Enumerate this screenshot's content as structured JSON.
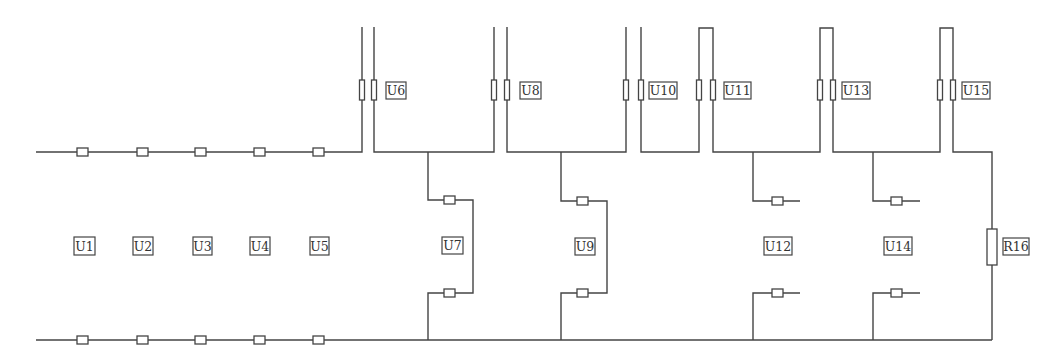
{
  "diagram": {
    "type": "circuit-schematic",
    "colors": {
      "line": "#444444",
      "background": "#ffffff",
      "text": "#333333"
    },
    "labels": {
      "U1": "U1",
      "U2": "U2",
      "U3": "U3",
      "U4": "U4",
      "U5": "U5",
      "U6": "U6",
      "U7": "U7",
      "U8": "U8",
      "U9": "U9",
      "U10": "U10",
      "U11": "U11",
      "U12": "U12",
      "U13": "U13",
      "U14": "U14",
      "U15": "U15",
      "R16": "R16"
    },
    "components": [
      {
        "id": "U1",
        "kind": "series-pair",
        "position": "left-bus"
      },
      {
        "id": "U2",
        "kind": "series-pair",
        "position": "left-bus"
      },
      {
        "id": "U3",
        "kind": "series-pair",
        "position": "left-bus"
      },
      {
        "id": "U4",
        "kind": "series-pair",
        "position": "left-bus"
      },
      {
        "id": "U5",
        "kind": "series-pair",
        "position": "left-bus"
      },
      {
        "id": "U6",
        "kind": "vertical-pair",
        "position": "top"
      },
      {
        "id": "U7",
        "kind": "bridge-branch",
        "position": "middle"
      },
      {
        "id": "U8",
        "kind": "vertical-pair",
        "position": "top"
      },
      {
        "id": "U9",
        "kind": "bridge-branch",
        "position": "middle"
      },
      {
        "id": "U10",
        "kind": "vertical-pair",
        "position": "top"
      },
      {
        "id": "U11",
        "kind": "looped-vertical-pair",
        "position": "top"
      },
      {
        "id": "U12",
        "kind": "open-branch",
        "position": "middle"
      },
      {
        "id": "U13",
        "kind": "looped-vertical-pair",
        "position": "top"
      },
      {
        "id": "U14",
        "kind": "open-branch",
        "position": "middle"
      },
      {
        "id": "U15",
        "kind": "looped-vertical-pair",
        "position": "top"
      },
      {
        "id": "R16",
        "kind": "resistor",
        "position": "right"
      }
    ]
  }
}
